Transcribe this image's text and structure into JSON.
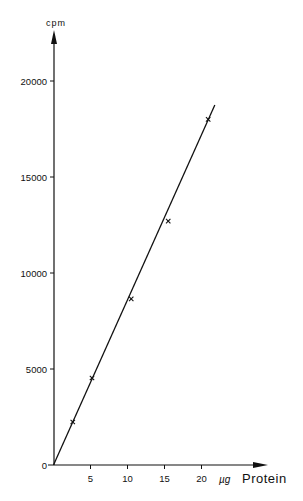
{
  "chart_data": {
    "type": "scatter",
    "title": "",
    "xlabel": "Protein",
    "xunit": "µg",
    "ylabel": "cpm",
    "xlim": [
      0,
      22
    ],
    "ylim": [
      0,
      21500
    ],
    "x_ticks": [
      5,
      10,
      15,
      20
    ],
    "y_ticks": [
      0,
      5000,
      10000,
      15000,
      20000
    ],
    "grid": false,
    "legend": null,
    "series": [
      {
        "name": "measured",
        "marker": "x",
        "x": [
          2.4,
          5.0,
          10.3,
          15.3,
          20.7
        ],
        "y": [
          2240,
          4530,
          8650,
          12700,
          18000
        ]
      }
    ],
    "fit_line": {
      "type": "linear",
      "from": [
        0,
        0
      ],
      "to": [
        21.8,
        18750
      ]
    }
  },
  "labels": {
    "y_title": "cpm",
    "x_unit": "µg",
    "x_title": "Protein",
    "y_tick_labels": [
      "0",
      "5000",
      "10000",
      "15000",
      "20000"
    ],
    "x_tick_labels": [
      "5",
      "10",
      "15",
      "20"
    ]
  }
}
